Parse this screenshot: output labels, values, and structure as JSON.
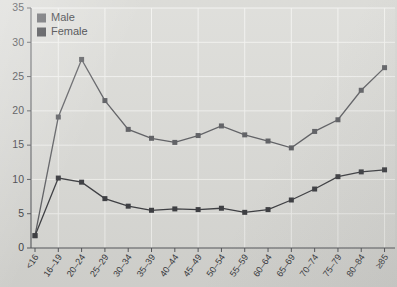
{
  "chart_data": {
    "type": "line",
    "title": "",
    "subtitle": "",
    "xlabel": "",
    "ylabel": "",
    "xlim_categories": true,
    "ylim": [
      0,
      35
    ],
    "ytick_step": 5,
    "yticks": [
      0,
      5,
      10,
      15,
      20,
      25,
      30,
      35
    ],
    "grid": true,
    "grid_axis": "both",
    "legend_position": "top-left",
    "categories": [
      "<16",
      "16–19",
      "20–24",
      "25–29",
      "30–34",
      "35–39",
      "40–44",
      "45–49",
      "50–54",
      "55–59",
      "60–64",
      "65–69",
      "70–74",
      "75–79",
      "80–84",
      "≥85"
    ],
    "series": [
      {
        "name": "Male",
        "color": "#5c5d61",
        "marker": "square",
        "values": [
          1.8,
          19.1,
          27.5,
          21.5,
          17.3,
          16.0,
          15.4,
          16.4,
          17.8,
          16.5,
          15.6,
          14.6,
          17.0,
          18.7,
          23.0,
          26.3
        ]
      },
      {
        "name": "Female",
        "color": "#3b3c40",
        "marker": "square",
        "values": [
          1.8,
          10.2,
          9.6,
          7.2,
          6.1,
          5.5,
          5.7,
          5.6,
          5.8,
          5.2,
          5.6,
          7.0,
          8.6,
          10.4,
          11.1,
          11.4
        ]
      }
    ]
  },
  "legend": {
    "items": [
      {
        "label": "Male"
      },
      {
        "label": "Female"
      }
    ]
  }
}
